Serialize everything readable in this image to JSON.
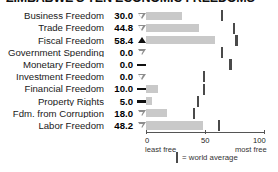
{
  "title": "ZIMBABWE'S TEN ECONOMIC FREEDOMS",
  "axis": {
    "ticks": [
      "0",
      "50",
      "100"
    ],
    "least_free": "least free",
    "most_free": "most free"
  },
  "legend": {
    "text": "= world average",
    "mark_name": "world-average-mark"
  },
  "chart_data": {
    "type": "bar",
    "title": "ZIMBABWE'S TEN ECONOMIC FREEDOMS",
    "xlabel": "",
    "ylabel": "",
    "xlim": [
      0,
      100
    ],
    "grid": false,
    "orientation": "horizontal",
    "legend_position": "bottom",
    "categories": [
      "Business Freedom",
      "Trade Freedom",
      "Fiscal Freedom",
      "Government Spending",
      "Monetary Freedom",
      "Investment Freedom",
      "Financial Freedom",
      "Property Rights",
      "Fdm. from Corruption",
      "Labor Freedom"
    ],
    "values": [
      30.0,
      44.8,
      58.4,
      0.0,
      0.0,
      0.0,
      10.0,
      5.0,
      18.0,
      48.2
    ],
    "value_labels": [
      "30.0",
      "44.8",
      "58.4",
      "0.0",
      "0.0",
      "0.0",
      "10.0",
      "5.0",
      "18.0",
      "48.2"
    ],
    "trend": [
      "down",
      "down",
      "up",
      "down",
      "flat",
      "down",
      "flat",
      "flat",
      "down",
      "down"
    ],
    "series": [
      {
        "name": "Zimbabwe score",
        "values": [
          30.0,
          44.8,
          58.4,
          0.0,
          0.0,
          0.0,
          10.0,
          5.0,
          18.0,
          48.2
        ]
      },
      {
        "name": "= world average",
        "values": [
          64,
          74,
          76,
          64,
          71,
          49,
          49,
          44,
          40,
          61
        ]
      }
    ]
  },
  "rows": [
    {
      "label": "Business Freedom",
      "value": "30.0",
      "trend": "down",
      "score": 30.0,
      "avg": 64
    },
    {
      "label": "Trade Freedom",
      "value": "44.8",
      "trend": "down",
      "score": 44.8,
      "avg": 74
    },
    {
      "label": "Fiscal Freedom",
      "value": "58.4",
      "trend": "up",
      "score": 58.4,
      "avg": 76
    },
    {
      "label": "Government Spending",
      "value": "0.0",
      "trend": "down",
      "score": 0.0,
      "avg": 64
    },
    {
      "label": "Monetary Freedom",
      "value": "0.0",
      "trend": "flat",
      "score": 0.0,
      "avg": 71
    },
    {
      "label": "Investment Freedom",
      "value": "0.0",
      "trend": "down",
      "score": 0.0,
      "avg": 49
    },
    {
      "label": "Financial Freedom",
      "value": "10.0",
      "trend": "flat",
      "score": 10.0,
      "avg": 49
    },
    {
      "label": "Property Rights",
      "value": "5.0",
      "trend": "flat",
      "score": 5.0,
      "avg": 44
    },
    {
      "label": "Fdm. from Corruption",
      "value": "18.0",
      "trend": "down",
      "score": 18.0,
      "avg": 40
    },
    {
      "label": "Labor Freedom",
      "value": "48.2",
      "trend": "down",
      "score": 48.2,
      "avg": 61
    }
  ]
}
